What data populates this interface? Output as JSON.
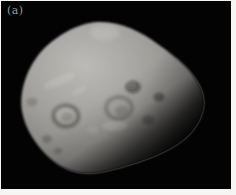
{
  "figure": {
    "panel_label": "(a)",
    "colors": {
      "background": "#030303",
      "frame": "#f6f5f3",
      "surface_bright": "#bdbbb7",
      "surface_light": "#a9a7a3",
      "surface_mid": "#908e8a",
      "surface_dim": "#6e6c68",
      "label": "#9b9b9b"
    }
  }
}
